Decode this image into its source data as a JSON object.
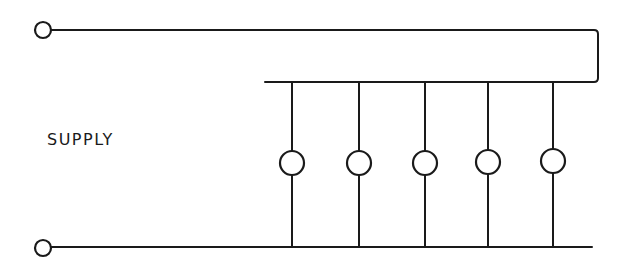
{
  "diagram": {
    "type": "parallel-lamp-circuit",
    "supply_label": "SUPPLY",
    "stroke_color": "#1a1a1a",
    "background_color": "#ffffff",
    "terminals": [
      {
        "id": "top",
        "cx": 43,
        "cy": 30,
        "r": 8
      },
      {
        "id": "bottom",
        "cx": 43,
        "cy": 248,
        "r": 8
      }
    ],
    "top_wire": {
      "y": 30,
      "x_start": 51,
      "x_end": 598,
      "drop_to_y": 81
    },
    "bus_wire": {
      "y": 82,
      "x_start": 265,
      "x_end": 598
    },
    "bottom_wire": {
      "y": 247,
      "x_start": 51,
      "x_end": 592
    },
    "lamps": [
      {
        "index": 1,
        "x": 292,
        "cy": 163,
        "r": 12
      },
      {
        "index": 2,
        "x": 359,
        "cy": 163,
        "r": 12
      },
      {
        "index": 3,
        "x": 425,
        "cy": 163,
        "r": 12
      },
      {
        "index": 4,
        "x": 488,
        "cy": 162,
        "r": 12
      },
      {
        "index": 5,
        "x": 553,
        "cy": 161,
        "r": 12
      }
    ],
    "lamp_count": 5
  }
}
